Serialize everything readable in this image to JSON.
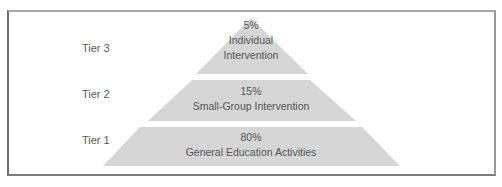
{
  "diagram": {
    "type": "pyramid",
    "fill_color": "#d6d6d6",
    "text_color": "#555555",
    "tiers": [
      {
        "label": "Tier 3",
        "percent": "5%",
        "line1": "Individual",
        "line2": "Intervention"
      },
      {
        "label": "Tier 2",
        "percent": "15%",
        "line1": "Small-Group Intervention"
      },
      {
        "label": "Tier 1",
        "percent": "80%",
        "line1": "General Education Activities"
      }
    ]
  }
}
